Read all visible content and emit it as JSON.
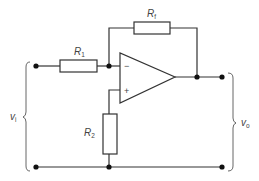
{
  "diagram": {
    "type": "circuit-schematic",
    "components": {
      "r1": {
        "label": "R",
        "subscript": "1"
      },
      "rf": {
        "label": "R",
        "subscript": "f"
      },
      "r2": {
        "label": "R",
        "subscript": "2"
      },
      "opamp": {
        "inverting": "−",
        "noninverting": "+"
      }
    },
    "terminals": {
      "input": {
        "label": "v",
        "subscript": "i"
      },
      "output": {
        "label": "v",
        "subscript": "o"
      }
    },
    "colors": {
      "line": "#333333",
      "text": "#444444",
      "background": "#ffffff"
    }
  }
}
